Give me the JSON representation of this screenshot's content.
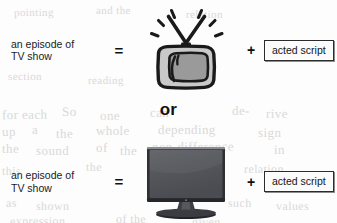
{
  "diagram": {
    "divider_label": "or",
    "rows": [
      {
        "id": "crt-row",
        "left_label_line1": "an episode of",
        "left_label_line2": "TV show",
        "equals": "=",
        "icon": "crt-television-icon",
        "plus": "+",
        "term_label": "acted script"
      },
      {
        "id": "lcd-row",
        "left_label_line1": "an episode of",
        "left_label_line2": "TV show",
        "equals": "=",
        "icon": "flatscreen-television-icon",
        "plus": "+",
        "term_label": "acted script"
      }
    ]
  },
  "colors": {
    "page_background": "#fdfdfd",
    "ink": "#141414",
    "crt_outline": "#1a1a1a",
    "crt_screen": "#9a9a9a",
    "crt_body": "#c9c9c9",
    "lcd_screen": "#555555",
    "lcd_bezel": "#2e2e2e",
    "ghost_text": "#d9d9d9"
  },
  "background_ghosts": [
    {
      "text": "pointing",
      "x": 14,
      "y": 6,
      "size": 11,
      "rotate": -0.4
    },
    {
      "text": "and the",
      "x": 96,
      "y": 4,
      "size": 11,
      "rotate": -0.3
    },
    {
      "text": "relation",
      "x": 186,
      "y": 8,
      "size": 11,
      "rotate": -0.2
    },
    {
      "text": "section",
      "x": 8,
      "y": 70,
      "size": 11,
      "rotate": -0.3
    },
    {
      "text": "reading",
      "x": 88,
      "y": 74,
      "size": 11,
      "rotate": -0.2
    },
    {
      "text": "for each",
      "x": 2,
      "y": 107,
      "size": 13,
      "rotate": -0.5
    },
    {
      "text": "So",
      "x": 62,
      "y": 104,
      "size": 13,
      "rotate": -0.4
    },
    {
      "text": "one",
      "x": 100,
      "y": 108,
      "size": 13,
      "rotate": -0.3
    },
    {
      "text": "can",
      "x": 150,
      "y": 105,
      "size": 13,
      "rotate": -0.3
    },
    {
      "text": "de-",
      "x": 232,
      "y": 103,
      "size": 13,
      "rotate": -0.4
    },
    {
      "text": "rive",
      "x": 266,
      "y": 106,
      "size": 13,
      "rotate": -0.3
    },
    {
      "text": "up",
      "x": 2,
      "y": 124,
      "size": 13,
      "rotate": -0.4
    },
    {
      "text": "a",
      "x": 32,
      "y": 122,
      "size": 13,
      "rotate": -0.3
    },
    {
      "text": "the",
      "x": 56,
      "y": 126,
      "size": 13,
      "rotate": -0.3
    },
    {
      "text": "whole",
      "x": 96,
      "y": 123,
      "size": 13,
      "rotate": -0.3
    },
    {
      "text": "depending",
      "x": 158,
      "y": 122,
      "size": 13,
      "rotate": -0.3
    },
    {
      "text": "sign",
      "x": 258,
      "y": 125,
      "size": 13,
      "rotate": -0.3
    },
    {
      "text": "the",
      "x": 2,
      "y": 141,
      "size": 13,
      "rotate": -0.4
    },
    {
      "text": "sound",
      "x": 36,
      "y": 143,
      "size": 13,
      "rotate": -0.3
    },
    {
      "text": "of",
      "x": 96,
      "y": 140,
      "size": 13,
      "rotate": -0.3
    },
    {
      "text": "the",
      "x": 120,
      "y": 143,
      "size": 13,
      "rotate": -0.3
    },
    {
      "text": "non-difference",
      "x": 152,
      "y": 139,
      "size": 13,
      "rotate": -0.3
    },
    {
      "text": "in",
      "x": 274,
      "y": 142,
      "size": 13,
      "rotate": -0.3
    },
    {
      "text": "this",
      "x": 2,
      "y": 164,
      "size": 12,
      "rotate": -0.3
    },
    {
      "text": "the",
      "x": 86,
      "y": 160,
      "size": 12,
      "rotate": -0.3
    },
    {
      "text": "relation",
      "x": 244,
      "y": 162,
      "size": 12,
      "rotate": -0.3
    },
    {
      "text": "as",
      "x": 6,
      "y": 196,
      "size": 12,
      "rotate": -0.3
    },
    {
      "text": "shown",
      "x": 36,
      "y": 199,
      "size": 12,
      "rotate": -0.3
    },
    {
      "text": "such",
      "x": 228,
      "y": 196,
      "size": 12,
      "rotate": -0.3
    },
    {
      "text": "values",
      "x": 276,
      "y": 199,
      "size": 12,
      "rotate": -0.3
    },
    {
      "text": "expression",
      "x": 10,
      "y": 214,
      "size": 12,
      "rotate": -0.3
    },
    {
      "text": "of the",
      "x": 116,
      "y": 212,
      "size": 12,
      "rotate": -0.3
    },
    {
      "text": "given",
      "x": 192,
      "y": 215,
      "size": 12,
      "rotate": -0.3
    }
  ]
}
